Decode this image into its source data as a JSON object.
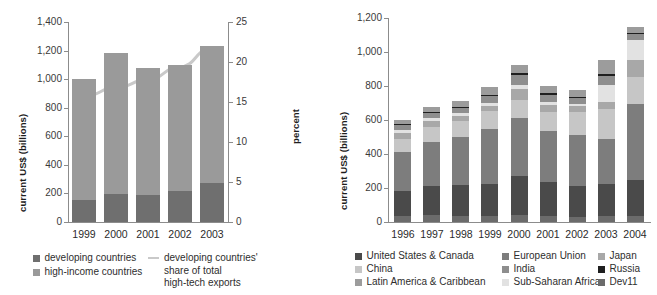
{
  "chart_data": [
    {
      "id": "left",
      "type": "bar",
      "title": "",
      "subtitle": "",
      "xlabel": "",
      "ylabel": "current US$ (billions)",
      "y2label": "percent",
      "grid": false,
      "legend_position": "bottom",
      "categories": [
        "1999",
        "2000",
        "2001",
        "2002",
        "2003"
      ],
      "ylim": [
        0,
        1400
      ],
      "yticks": [
        "0",
        "200",
        "400",
        "600",
        "800",
        "1,000",
        "1,200",
        "1,400"
      ],
      "ytick_values": [
        0,
        200,
        400,
        600,
        800,
        1000,
        1200,
        1400
      ],
      "y2lim": [
        0,
        25
      ],
      "y2ticks": [
        "0",
        "5",
        "10",
        "15",
        "20",
        "25"
      ],
      "y2tick_values": [
        0,
        5,
        10,
        15,
        20,
        25
      ],
      "series": [
        {
          "name": "developing countries",
          "color": "#6f6f6f",
          "values": [
            155,
            195,
            190,
            215,
            270
          ]
        },
        {
          "name": "high-income countries",
          "color": "#9a9a9a",
          "values": [
            845,
            990,
            890,
            885,
            965
          ]
        }
      ],
      "line_series": {
        "name": "developing countries' share of total high-tech exports",
        "color": "#c9c9c9",
        "axis": "right",
        "values": [
          15.7,
          16.8,
          17.8,
          19.4,
          21.8
        ]
      },
      "legend": [
        {
          "label": "developing countries",
          "color": "#6f6f6f",
          "marker": "square"
        },
        {
          "label": "high-income countries",
          "color": "#9a9a9a",
          "marker": "square"
        },
        {
          "label": "developing countries'\nshare of total\nhigh-tech exports",
          "color": "#c9c9c9",
          "marker": "line"
        }
      ]
    },
    {
      "id": "right",
      "type": "bar",
      "title": "",
      "subtitle": "",
      "xlabel": "",
      "ylabel": "current US$ (billions)",
      "grid": false,
      "legend_position": "bottom",
      "categories": [
        "1996",
        "1997",
        "1998",
        "1999",
        "2000",
        "2001",
        "2002",
        "2003",
        "2004"
      ],
      "ylim": [
        0,
        1200
      ],
      "yticks": [
        "0",
        "200",
        "400",
        "600",
        "800",
        "1,000",
        "1,200"
      ],
      "ytick_values": [
        0,
        200,
        400,
        600,
        800,
        1000,
        1200
      ],
      "stack_order": [
        "Dev11",
        "United States & Canada",
        "European Union",
        "China",
        "Japan",
        "Sub-Saharan Africa",
        "India",
        "Russia",
        "Latin America & Caribbean"
      ],
      "series": [
        {
          "name": "Dev11",
          "color": "#6b6b6b",
          "values": [
            35,
            40,
            35,
            35,
            40,
            35,
            30,
            35,
            35
          ]
        },
        {
          "name": "United States & Canada",
          "color": "#4a4a4a",
          "values": [
            145,
            170,
            180,
            190,
            230,
            200,
            180,
            190,
            210
          ]
        },
        {
          "name": "European Union",
          "color": "#7d7d7d",
          "values": [
            230,
            260,
            285,
            320,
            340,
            300,
            300,
            265,
            450
          ]
        },
        {
          "name": "China",
          "color": "#c6c6c6",
          "values": [
            80,
            90,
            95,
            110,
            110,
            115,
            140,
            175,
            160
          ]
        },
        {
          "name": "Japan",
          "color": "#a8a8a8",
          "values": [
            35,
            35,
            30,
            30,
            60,
            40,
            30,
            40,
            100
          ]
        },
        {
          "name": "Sub-Saharan Africa",
          "color": "#e2e2e2",
          "values": [
            15,
            15,
            15,
            15,
            25,
            15,
            15,
            100,
            115
          ]
        },
        {
          "name": "India",
          "color": "#8e8e8e",
          "values": [
            30,
            30,
            30,
            40,
            60,
            45,
            35,
            55,
            35
          ]
        },
        {
          "name": "Russia",
          "color": "#1f1f1f",
          "values": [
            8,
            8,
            8,
            8,
            10,
            8,
            8,
            10,
            10
          ]
        },
        {
          "name": "Latin America & Caribbean",
          "color": "#9c9c9c",
          "values": [
            25,
            30,
            35,
            45,
            50,
            45,
            40,
            85,
            30
          ]
        }
      ],
      "totals": [
        603,
        678,
        713,
        793,
        925,
        803,
        778,
        955,
        1145
      ],
      "legend": [
        {
          "label": "United States & Canada",
          "color": "#4a4a4a",
          "marker": "square"
        },
        {
          "label": "European Union",
          "color": "#7d7d7d",
          "marker": "square"
        },
        {
          "label": "Japan",
          "color": "#a8a8a8",
          "marker": "square"
        },
        {
          "label": "China",
          "color": "#c6c6c6",
          "marker": "square"
        },
        {
          "label": "India",
          "color": "#8e8e8e",
          "marker": "square"
        },
        {
          "label": "Russia",
          "color": "#1f1f1f",
          "marker": "square"
        },
        {
          "label": "Latin America & Caribbean",
          "color": "#9c9c9c",
          "marker": "square"
        },
        {
          "label": "Sub-Saharan Africa",
          "color": "#e2e2e2",
          "marker": "square"
        },
        {
          "label": "Dev11",
          "color": "#6b6b6b",
          "marker": "square"
        }
      ]
    }
  ]
}
